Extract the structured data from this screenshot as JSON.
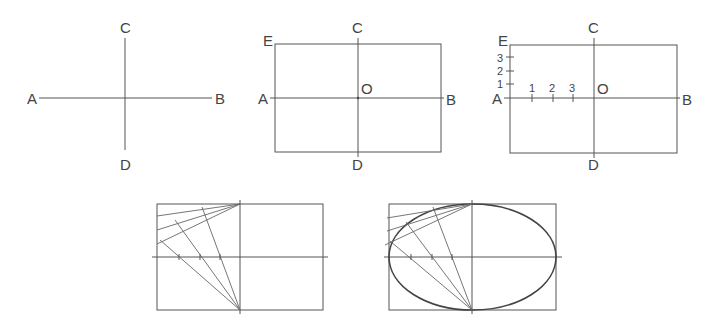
{
  "figures": [
    {
      "id": "fig1",
      "description": "Two perpendicular axes",
      "labels": {
        "a": "A",
        "b": "B",
        "c": "C",
        "d": "D"
      }
    },
    {
      "id": "fig2",
      "description": "Rectangle enclosing axes with center O",
      "labels": {
        "a": "A",
        "b": "B",
        "c": "C",
        "d": "D",
        "e": "E",
        "o": "O"
      }
    },
    {
      "id": "fig3",
      "description": "Rectangle with divisions on AO and AE",
      "labels": {
        "a": "A",
        "b": "B",
        "c": "C",
        "d": "D",
        "e": "E",
        "o": "O"
      },
      "divisions_ao": [
        "1",
        "2",
        "3"
      ],
      "divisions_ae": [
        "1",
        "2",
        "3"
      ]
    },
    {
      "id": "fig4",
      "description": "Construction lines from C and D through divisions"
    },
    {
      "id": "fig5",
      "description": "Completed ellipse through intersection points"
    }
  ]
}
